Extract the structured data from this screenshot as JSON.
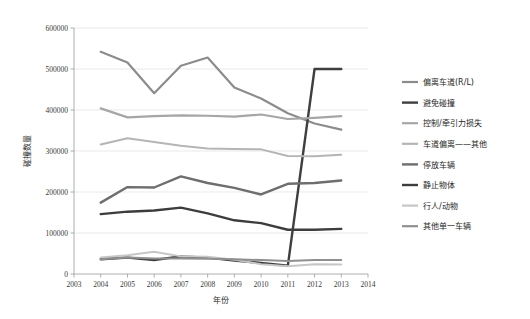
{
  "chart_data": {
    "type": "line",
    "title": "",
    "xlabel": "年份",
    "ylabel": "碰撞数量",
    "x": [
      2004,
      2005,
      2006,
      2007,
      2008,
      2009,
      2010,
      2011,
      2012,
      2013
    ],
    "xlim": [
      2003,
      2014
    ],
    "ylim": [
      0,
      600000
    ],
    "ytick_labels": [
      "0",
      "100000",
      "200000",
      "300000",
      "400000",
      "500000",
      "600000"
    ],
    "yticks": [
      0,
      100000,
      200000,
      300000,
      400000,
      500000,
      600000
    ],
    "xtick_labels": [
      "2003",
      "2004",
      "2005",
      "2006",
      "2007",
      "2008",
      "2009",
      "2010",
      "2011",
      "2012",
      "2013",
      "2014"
    ],
    "grid": true,
    "grid_axis": "y",
    "legend_position": "right",
    "series": [
      {
        "name": "偏离车道(R/L)",
        "color": "#8c8c8c",
        "width": 2.2,
        "values": [
          542000,
          516000,
          441000,
          508000,
          528000,
          455000,
          428000,
          392000,
          367000,
          352000
        ]
      },
      {
        "name": "避免碰撞",
        "color": "#3f3f3f",
        "width": 2.4,
        "values": [
          36000,
          40000,
          34000,
          43000,
          40000,
          33000,
          27000,
          20000,
          500000,
          500000
        ]
      },
      {
        "name": "控制/牵引力损失",
        "color": "#a6a6a6",
        "width": 2.2,
        "values": [
          404000,
          382000,
          385000,
          387000,
          386000,
          384000,
          389000,
          378000,
          381000,
          385000
        ]
      },
      {
        "name": "车道偏离——其他",
        "color": "#b5b5b5",
        "width": 2.0,
        "values": [
          316000,
          331000,
          322000,
          313000,
          306000,
          305000,
          304000,
          288000,
          287000,
          291000
        ]
      },
      {
        "name": "停放车辆",
        "color": "#6e6e6e",
        "width": 2.4,
        "values": [
          174000,
          212000,
          211000,
          238000,
          222000,
          210000,
          194000,
          220000,
          222000,
          228000
        ]
      },
      {
        "name": "静止物体",
        "color": "#3d3d3d",
        "width": 2.4,
        "values": [
          146000,
          152000,
          155000,
          162000,
          148000,
          131000,
          124000,
          108000,
          108000,
          110000
        ]
      },
      {
        "name": "行人/动物",
        "color": "#c6c6c6",
        "width": 2.0,
        "values": [
          40000,
          46000,
          54000,
          43000,
          42000,
          35000,
          24000,
          19000,
          24000,
          23000
        ]
      },
      {
        "name": "其他单一车辆",
        "color": "#8f8f8f",
        "width": 2.0,
        "values": [
          36000,
          40000,
          38000,
          38000,
          37000,
          36000,
          34000,
          32000,
          34000,
          34000
        ]
      }
    ]
  },
  "axes": {
    "y_title": "碰撞数量",
    "x_title": "年份"
  }
}
